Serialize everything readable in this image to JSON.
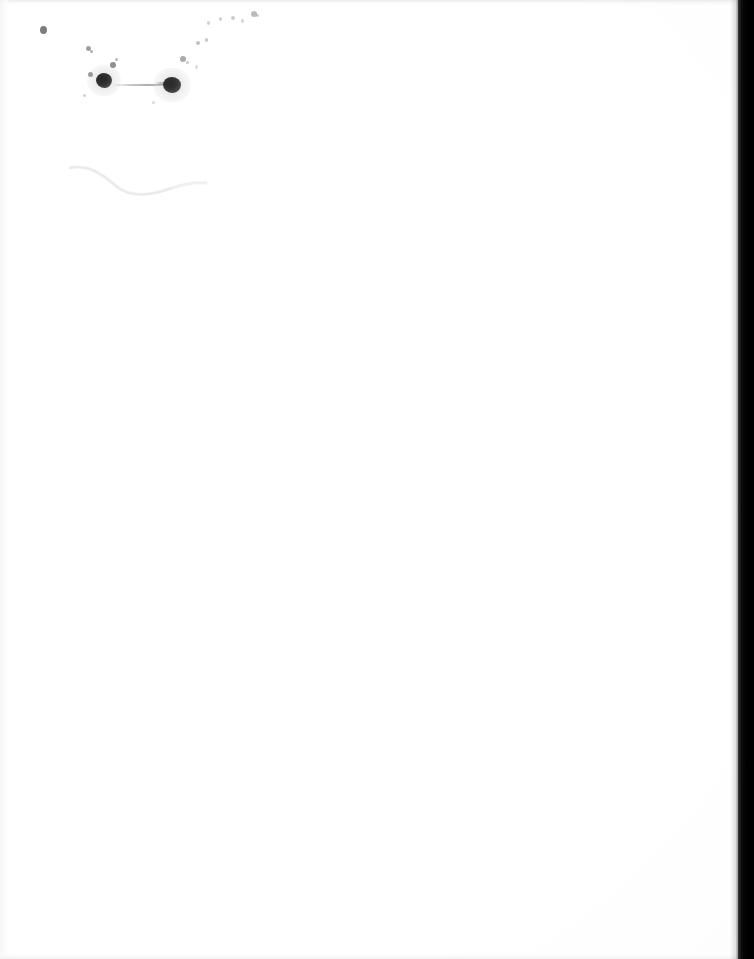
{
  "document": {
    "type": "scanned-page",
    "appearance": "blank",
    "visible_text": "",
    "page_color": "#ffffff",
    "ink_color": "#1f1f1f",
    "scanner_edge_color": "#000000",
    "width_px": 754,
    "height_px": 959
  },
  "page_regions": {
    "paper_label": "",
    "right_edge_label": "",
    "content_area_label": ""
  },
  "marks": {
    "description": "",
    "specks": [
      {
        "name": "speck-left-isolated",
        "x": 40,
        "y": 26,
        "w": 7,
        "h": 8,
        "opacity": 0.62
      },
      {
        "name": "speck-upper-a",
        "x": 86,
        "y": 46,
        "w": 5,
        "h": 5,
        "opacity": 0.45
      },
      {
        "name": "speck-upper-b",
        "x": 90,
        "y": 50,
        "w": 3,
        "h": 3,
        "opacity": 0.38
      },
      {
        "name": "speck-mid-a",
        "x": 110,
        "y": 62,
        "w": 6,
        "h": 6,
        "opacity": 0.52
      },
      {
        "name": "speck-mid-b",
        "x": 115,
        "y": 58,
        "w": 3,
        "h": 3,
        "opacity": 0.34
      },
      {
        "name": "speck-mid-c",
        "x": 88,
        "y": 72,
        "w": 5,
        "h": 5,
        "opacity": 0.46
      },
      {
        "name": "speck-low-a",
        "x": 83,
        "y": 94,
        "w": 3,
        "h": 3,
        "opacity": 0.22
      },
      {
        "name": "speck-low-b",
        "x": 152,
        "y": 101,
        "w": 3,
        "h": 3,
        "opacity": 0.18
      },
      {
        "name": "speck-right-a",
        "x": 180,
        "y": 56,
        "w": 6,
        "h": 6,
        "opacity": 0.4
      },
      {
        "name": "speck-right-b",
        "x": 186,
        "y": 61,
        "w": 3,
        "h": 3,
        "opacity": 0.25
      },
      {
        "name": "speck-right-c",
        "x": 196,
        "y": 41,
        "w": 4,
        "h": 4,
        "opacity": 0.3
      },
      {
        "name": "speck-right-d",
        "x": 205,
        "y": 38,
        "w": 3,
        "h": 4,
        "opacity": 0.26
      },
      {
        "name": "speck-right-e",
        "x": 195,
        "y": 65,
        "w": 3,
        "h": 4,
        "opacity": 0.18
      },
      {
        "name": "speck-arc-a",
        "x": 207,
        "y": 21,
        "w": 3,
        "h": 4,
        "opacity": 0.22
      },
      {
        "name": "speck-arc-b",
        "x": 219,
        "y": 17,
        "w": 3,
        "h": 4,
        "opacity": 0.22
      },
      {
        "name": "speck-arc-c",
        "x": 231,
        "y": 16,
        "w": 4,
        "h": 4,
        "opacity": 0.24
      },
      {
        "name": "speck-arc-d",
        "x": 241,
        "y": 19,
        "w": 3,
        "h": 4,
        "opacity": 0.2
      },
      {
        "name": "speck-arc-e",
        "x": 251,
        "y": 11,
        "w": 6,
        "h": 6,
        "opacity": 0.32
      },
      {
        "name": "speck-arc-f",
        "x": 256,
        "y": 14,
        "w": 3,
        "h": 3,
        "opacity": 0.22
      }
    ],
    "blots": [
      {
        "name": "ink-blot-left",
        "x": 96,
        "y": 73,
        "w": 16,
        "h": 15,
        "opacity": 0.92
      },
      {
        "name": "ink-blot-right",
        "x": 163,
        "y": 77,
        "w": 18,
        "h": 16,
        "opacity": 0.9
      }
    ],
    "streaks": [
      {
        "name": "ink-streak-connector",
        "x": 112,
        "y": 84,
        "w": 54,
        "h": 2,
        "opacity": 0.55
      },
      {
        "name": "ink-streak-tail",
        "x": 155,
        "y": 82,
        "w": 14,
        "h": 3,
        "opacity": 0.45
      }
    ],
    "crease": {
      "name": "page-crease-line",
      "opacity": 0.18
    }
  }
}
